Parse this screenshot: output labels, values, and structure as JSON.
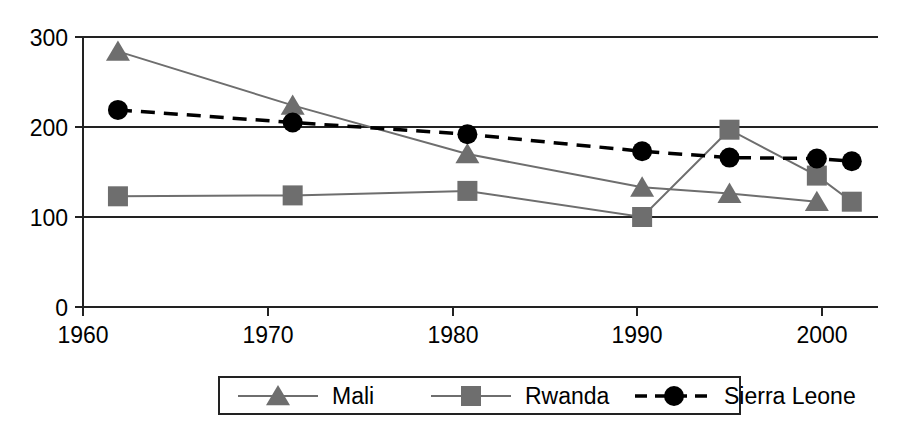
{
  "chart_data": {
    "type": "line",
    "title": "",
    "xlabel": "",
    "ylabel": "",
    "xlim": [
      1958.5,
      2004.0
    ],
    "ylim": [
      0,
      300
    ],
    "xticks": [
      1960,
      1970,
      1980,
      1990,
      2000
    ],
    "xticklabels": [
      "1960",
      "1970",
      "1980",
      "1990",
      "2000"
    ],
    "yticks": [
      0,
      100,
      200,
      300
    ],
    "yticklabels": [
      "0",
      "100",
      "200",
      "300"
    ],
    "grid": "horizontal",
    "legend_position": "bottom-center",
    "series": [
      {
        "name": "Mali",
        "marker": "triangle",
        "color": "#6e6e6e",
        "line_color": "#6e6e6e",
        "line_style": "solid",
        "x": [
          1960.5,
          1970.5,
          1980.5,
          1990.5,
          1995.5,
          2000.5
        ],
        "values": [
          284,
          224,
          170,
          133,
          126,
          117
        ]
      },
      {
        "name": "Rwanda",
        "marker": "square",
        "color": "#6e6e6e",
        "line_color": "#6e6e6e",
        "line_style": "solid",
        "x": [
          1960.5,
          1970.5,
          1980.5,
          1990.5,
          1995.5,
          2000.5,
          2002.5
        ],
        "values": [
          123,
          124,
          129,
          100,
          197,
          146,
          117
        ]
      },
      {
        "name": "Sierra Leone",
        "marker": "circle",
        "color": "#000000",
        "line_color": "#000000",
        "line_style": "dashed",
        "x": [
          1960.5,
          1970.5,
          1980.5,
          1990.5,
          1995.5,
          2000.5,
          2002.5
        ],
        "values": [
          219,
          205,
          192,
          173,
          166,
          165,
          162
        ]
      }
    ]
  },
  "axis": {
    "ytick_0": "0",
    "ytick_100": "100",
    "ytick_200": "200",
    "ytick_300": "300",
    "xtick_1960": "1960",
    "xtick_1970": "1970",
    "xtick_1980": "1980",
    "xtick_1990": "1990",
    "xtick_2000": "2000"
  },
  "legend": {
    "items": [
      {
        "label": "Mali"
      },
      {
        "label": "Rwanda"
      },
      {
        "label": "Sierra Leone"
      }
    ]
  }
}
